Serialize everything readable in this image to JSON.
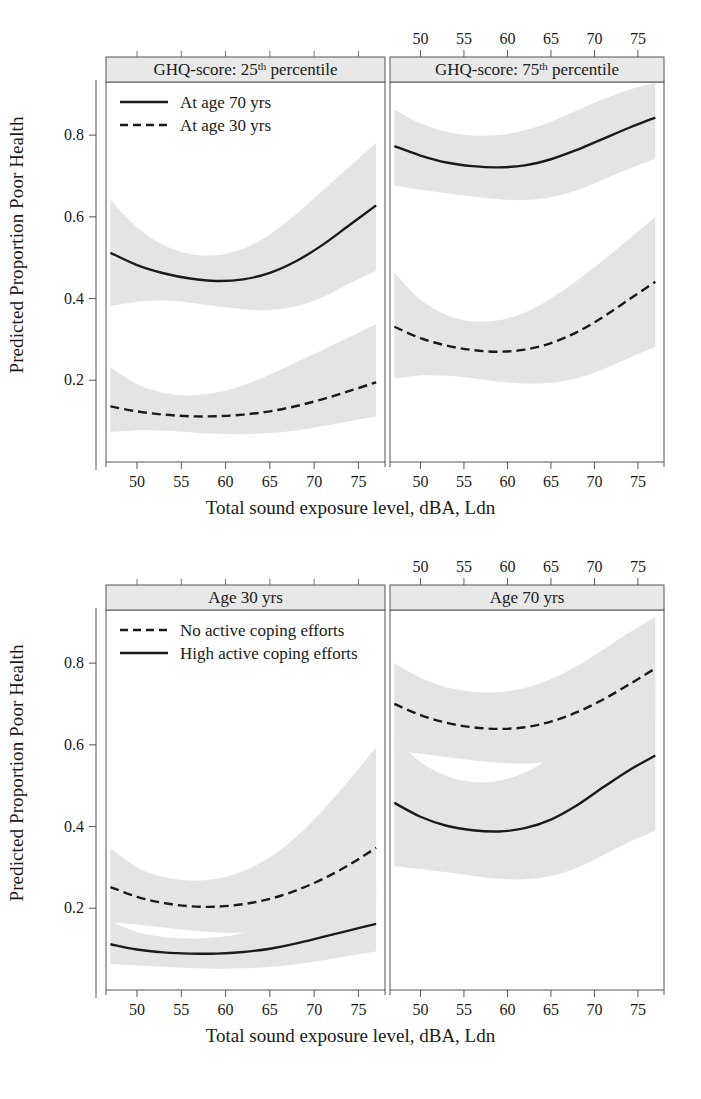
{
  "figure": {
    "ylabel": "Predicted Proportion Poor Health",
    "xlabel": "Total sound exposure level, dBA, Ldn",
    "band_color": "#e4e4e4",
    "line_color": "#1a1a1a",
    "strip_fill": "#e8e8e8"
  },
  "axes": {
    "x_ticks": [
      "50",
      "55",
      "60",
      "65",
      "70",
      "75"
    ],
    "y_ticks": [
      "0.2",
      "0.4",
      "0.6",
      "0.8"
    ],
    "xlim": [
      46.5,
      78.0
    ],
    "ylim": [
      0.0,
      0.93
    ]
  },
  "panel_top_left": {
    "strip_main": "GHQ-score: 25",
    "strip_sup": "th",
    "strip_tail": " percentile"
  },
  "panel_top_right": {
    "strip_main": "GHQ-score: 75",
    "strip_sup": "th",
    "strip_tail": " percentile"
  },
  "panel_bottom_left": {
    "strip": "Age 30 yrs"
  },
  "panel_bottom_right": {
    "strip": "Age 70 yrs"
  },
  "legend_top": {
    "items": [
      {
        "label": "At age 70 yrs",
        "style": "solid"
      },
      {
        "label": "At age 30 yrs",
        "style": "dashed"
      }
    ]
  },
  "legend_bottom": {
    "items": [
      {
        "label": "No active coping efforts",
        "style": "dashed"
      },
      {
        "label": "High active coping efforts",
        "style": "solid"
      }
    ]
  },
  "chart_data": {
    "type": "line",
    "title": "",
    "xlabel": "Total sound exposure level, dBA, Ldn",
    "ylabel": "Predicted Proportion Poor Health",
    "xlim": [
      46.5,
      78.0
    ],
    "ylim": [
      0.0,
      0.93
    ],
    "x_ticks": [
      50,
      55,
      60,
      65,
      70,
      75
    ],
    "y_ticks": [
      0.2,
      0.4,
      0.6,
      0.8
    ],
    "grid": false,
    "legend_position": "top-left inside panel",
    "panels": [
      {
        "row": 0,
        "col": 0,
        "strip": "GHQ-score: 25th percentile",
        "x": [
          47,
          50,
          53,
          56,
          59,
          62,
          65,
          68,
          71,
          74,
          77
        ],
        "series": [
          {
            "name": "At age 70 yrs",
            "style": "solid",
            "values": [
              0.512,
              0.482,
              0.462,
              0.449,
              0.443,
              0.447,
              0.463,
              0.492,
              0.532,
              0.58,
              0.628
            ],
            "ci_lower": [
              0.381,
              0.392,
              0.395,
              0.39,
              0.381,
              0.374,
              0.372,
              0.381,
              0.404,
              0.437,
              0.468
            ],
            "ci_upper": [
              0.641,
              0.574,
              0.531,
              0.509,
              0.506,
              0.522,
              0.557,
              0.607,
              0.665,
              0.723,
              0.781
            ]
          },
          {
            "name": "At age 30 yrs",
            "style": "dashed",
            "values": [
              0.136,
              0.124,
              0.116,
              0.112,
              0.112,
              0.116,
              0.124,
              0.137,
              0.154,
              0.174,
              0.195
            ],
            "ci_lower": [
              0.073,
              0.078,
              0.077,
              0.073,
              0.069,
              0.068,
              0.071,
              0.077,
              0.088,
              0.1,
              0.112
            ],
            "ci_upper": [
              0.232,
              0.19,
              0.169,
              0.163,
              0.17,
              0.188,
              0.214,
              0.244,
              0.275,
              0.306,
              0.337
            ]
          }
        ]
      },
      {
        "row": 0,
        "col": 1,
        "strip": "GHQ-score: 75th percentile",
        "x": [
          47,
          50,
          53,
          56,
          59,
          62,
          65,
          68,
          71,
          74,
          77
        ],
        "series": [
          {
            "name": "At age 70 yrs",
            "style": "solid",
            "values": [
              0.773,
              0.75,
              0.733,
              0.724,
              0.721,
              0.726,
              0.741,
              0.764,
              0.791,
              0.818,
              0.843
            ],
            "ci_lower": [
              0.676,
              0.666,
              0.658,
              0.65,
              0.643,
              0.641,
              0.648,
              0.665,
              0.691,
              0.718,
              0.742
            ],
            "ci_upper": [
              0.862,
              0.829,
              0.808,
              0.799,
              0.8,
              0.812,
              0.833,
              0.86,
              0.888,
              0.911,
              0.928
            ]
          },
          {
            "name": "At age 30 yrs",
            "style": "dashed",
            "values": [
              0.331,
              0.303,
              0.285,
              0.274,
              0.27,
              0.275,
              0.291,
              0.318,
              0.355,
              0.398,
              0.441
            ],
            "ci_lower": [
              0.204,
              0.212,
              0.211,
              0.205,
              0.197,
              0.192,
              0.194,
              0.205,
              0.227,
              0.255,
              0.282
            ],
            "ci_upper": [
              0.463,
              0.397,
              0.36,
              0.344,
              0.347,
              0.366,
              0.4,
              0.444,
              0.494,
              0.546,
              0.6
            ]
          }
        ]
      },
      {
        "row": 1,
        "col": 0,
        "strip": "Age 30 yrs",
        "x": [
          47,
          50,
          53,
          56,
          59,
          62,
          65,
          68,
          71,
          74,
          77
        ],
        "series": [
          {
            "name": "No active coping efforts",
            "style": "dashed",
            "values": [
              0.252,
              0.228,
              0.213,
              0.205,
              0.204,
              0.21,
              0.223,
              0.244,
              0.272,
              0.307,
              0.348
            ],
            "ci_lower": [
              0.165,
              0.16,
              0.153,
              0.146,
              0.141,
              0.14,
              0.144,
              0.155,
              0.173,
              0.197,
              0.225
            ],
            "ci_upper": [
              0.346,
              0.3,
              0.277,
              0.268,
              0.272,
              0.291,
              0.325,
              0.375,
              0.44,
              0.515,
              0.594
            ]
          },
          {
            "name": "High active coping efforts",
            "style": "solid",
            "values": [
              0.112,
              0.099,
              0.092,
              0.089,
              0.089,
              0.093,
              0.101,
              0.114,
              0.13,
              0.146,
              0.162
            ],
            "ci_lower": [
              0.063,
              0.06,
              0.057,
              0.054,
              0.052,
              0.053,
              0.056,
              0.063,
              0.073,
              0.084,
              0.094
            ],
            "ci_upper": [
              0.168,
              0.142,
              0.13,
              0.126,
              0.129,
              0.139,
              0.156,
              0.18,
              0.208,
              0.236,
              0.262
            ]
          }
        ]
      },
      {
        "row": 1,
        "col": 1,
        "strip": "Age 70 yrs",
        "x": [
          47,
          50,
          53,
          56,
          59,
          62,
          65,
          68,
          71,
          74,
          77
        ],
        "series": [
          {
            "name": "No active coping efforts",
            "style": "dashed",
            "values": [
              0.7,
              0.673,
              0.654,
              0.643,
              0.639,
              0.643,
              0.657,
              0.68,
              0.711,
              0.748,
              0.787
            ],
            "ci_lower": [
              0.588,
              0.578,
              0.57,
              0.562,
              0.556,
              0.554,
              0.56,
              0.576,
              0.601,
              0.633,
              0.668
            ],
            "ci_upper": [
              0.8,
              0.764,
              0.741,
              0.73,
              0.729,
              0.739,
              0.761,
              0.793,
              0.833,
              0.875,
              0.913
            ]
          },
          {
            "name": "High active coping efforts",
            "style": "solid",
            "values": [
              0.458,
              0.424,
              0.402,
              0.391,
              0.388,
              0.396,
              0.417,
              0.452,
              0.496,
              0.538,
              0.574
            ],
            "ci_lower": [
              0.303,
              0.296,
              0.288,
              0.279,
              0.272,
              0.271,
              0.279,
              0.299,
              0.33,
              0.362,
              0.39
            ],
            "ci_upper": [
              0.617,
              0.558,
              0.524,
              0.509,
              0.512,
              0.532,
              0.569,
              0.618,
              0.67,
              0.716,
              0.755
            ]
          }
        ]
      }
    ]
  }
}
